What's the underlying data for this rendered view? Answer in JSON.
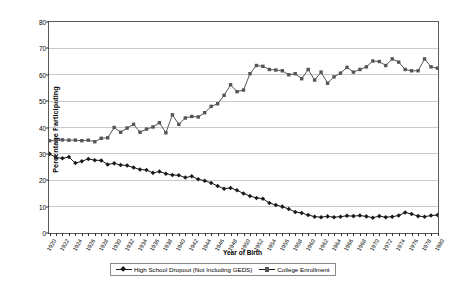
{
  "chart_data": {
    "type": "line",
    "title": "",
    "xlabel": "Year of Birth",
    "ylabel": "Percentage Participating",
    "ylim": [
      0,
      80
    ],
    "ytick_step": 10,
    "yticks": [
      0,
      10,
      20,
      30,
      40,
      50,
      60,
      70,
      80
    ],
    "grid": "horizontal",
    "legend_position": "bottom-center",
    "x": [
      1920,
      1921,
      1922,
      1923,
      1924,
      1925,
      1926,
      1927,
      1928,
      1929,
      1930,
      1931,
      1932,
      1933,
      1934,
      1935,
      1936,
      1937,
      1938,
      1939,
      1940,
      1941,
      1942,
      1943,
      1944,
      1945,
      1946,
      1947,
      1948,
      1949,
      1950,
      1951,
      1952,
      1953,
      1954,
      1955,
      1956,
      1957,
      1958,
      1959,
      1960,
      1961,
      1962,
      1963,
      1964,
      1965,
      1966,
      1967,
      1968,
      1969,
      1970,
      1971,
      1972,
      1973,
      1974,
      1975,
      1976,
      1977,
      1978,
      1979,
      1980
    ],
    "xtick_labels": [
      "1920",
      "1922",
      "1924",
      "1926",
      "1928",
      "1930",
      "1932",
      "1934",
      "1936",
      "1938",
      "1940",
      "1942",
      "1944",
      "1946",
      "1948",
      "1950",
      "1952",
      "1954",
      "1956",
      "1958",
      "1960",
      "1962",
      "1964",
      "1966",
      "1968",
      "1970",
      "1972",
      "1974",
      "1976",
      "1978",
      "1980"
    ],
    "xtick_step": 2,
    "series": [
      {
        "name": "High School Dropout (Not Including GEDS)",
        "marker": "diamond",
        "color": "#1a1a1a",
        "values": [
          30.0,
          28.6,
          28.3,
          28.8,
          26.5,
          27.2,
          28.1,
          27.6,
          27.5,
          26.0,
          26.4,
          25.8,
          25.6,
          24.8,
          24.1,
          23.9,
          22.8,
          23.3,
          22.5,
          22.0,
          21.9,
          21.0,
          21.5,
          20.4,
          19.8,
          19.0,
          17.8,
          16.8,
          17.1,
          16.2,
          15.0,
          14.0,
          13.3,
          13.0,
          11.4,
          10.6,
          10.0,
          9.1,
          8.0,
          7.6,
          6.8,
          6.2,
          6.0,
          6.3,
          6.0,
          6.2,
          6.5,
          6.4,
          6.6,
          6.3,
          5.8,
          6.4,
          6.0,
          6.2,
          6.6,
          7.8,
          7.2,
          6.4,
          6.2,
          6.6,
          6.8
        ]
      },
      {
        "name": "College Enrollment",
        "marker": "square",
        "color": "#555555",
        "values": [
          35.0,
          35.0,
          35.3,
          35.2,
          35.2,
          35.0,
          35.2,
          34.6,
          35.9,
          36.1,
          40.0,
          38.2,
          39.8,
          41.2,
          38.2,
          39.4,
          40.2,
          41.8,
          38.0,
          44.8,
          41.2,
          43.6,
          44.2,
          44.0,
          45.6,
          48.0,
          49.0,
          52.2,
          56.2,
          53.6,
          54.2,
          60.4,
          63.5,
          63.2,
          62.0,
          61.8,
          61.5,
          60.0,
          60.4,
          58.5,
          62.0,
          58.0,
          61.0,
          56.8,
          59.2,
          60.6,
          62.8,
          61.0,
          62.0,
          63.0,
          65.2,
          65.0,
          63.5,
          66.0,
          64.8,
          62.0,
          61.5,
          61.5,
          66.0,
          63.0,
          62.5
        ]
      }
    ]
  },
  "legend": {
    "items": [
      {
        "label": "High School Dropout (Not Including GEDS)"
      },
      {
        "label": "College Enrollment"
      }
    ]
  }
}
